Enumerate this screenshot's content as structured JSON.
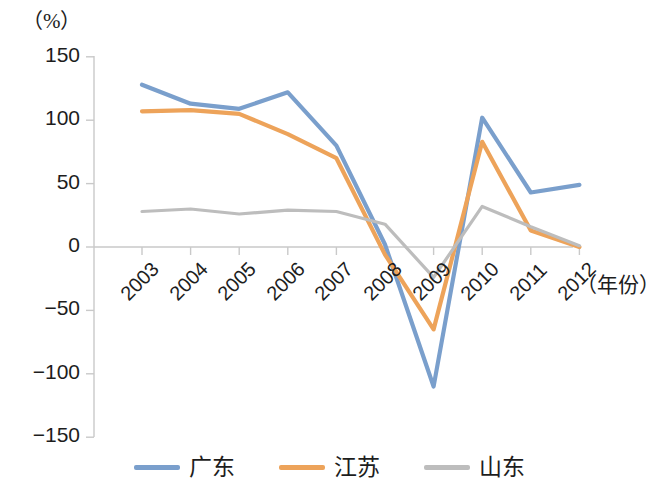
{
  "chart_data": {
    "type": "line",
    "title": "",
    "subtitle": "",
    "unit_label": "（%）",
    "xlabel": "（年份）",
    "ylabel": "",
    "categories": [
      "2003",
      "2004",
      "2005",
      "2006",
      "2007",
      "2008",
      "2009",
      "2010",
      "2011",
      "2012"
    ],
    "x_tick_labels": [
      "2003",
      "2004",
      "2005",
      "2006",
      "2007",
      "2008",
      "2009",
      "2010",
      "2011",
      "2012"
    ],
    "y_tick_labels": [
      "150",
      "100",
      "50",
      "0",
      "−50",
      "−100",
      "−150"
    ],
    "y_tick_values": [
      150,
      100,
      50,
      0,
      -50,
      -100,
      -150
    ],
    "ylim": [
      -150,
      150
    ],
    "grid": false,
    "zero_line": true,
    "legend_position": "bottom",
    "series": [
      {
        "name": "广东",
        "color": "#7a9fcc",
        "values": [
          128,
          113,
          109,
          122,
          80,
          2,
          -110,
          102,
          43,
          49
        ]
      },
      {
        "name": "江苏",
        "color": "#eda35a",
        "values": [
          107,
          108,
          105,
          89,
          70,
          -6,
          -65,
          83,
          13,
          0
        ]
      },
      {
        "name": "山东",
        "color": "#bdbdbd",
        "values": [
          28,
          30,
          26,
          29,
          28,
          18,
          -24,
          32,
          16,
          1
        ]
      }
    ]
  },
  "legend": {
    "items": [
      {
        "label": "广东",
        "color": "#7a9fcc"
      },
      {
        "label": "江苏",
        "color": "#eda35a"
      },
      {
        "label": "山东",
        "color": "#bdbdbd"
      }
    ]
  },
  "axes": {
    "unit_label": "（%）",
    "x_title": "（年份）"
  },
  "colors": {
    "guangdong": "#7a9fcc",
    "jiangsu": "#eda35a",
    "shandong": "#bdbdbd",
    "axis": "#c9c9c9",
    "text": "#1d1d1d"
  }
}
